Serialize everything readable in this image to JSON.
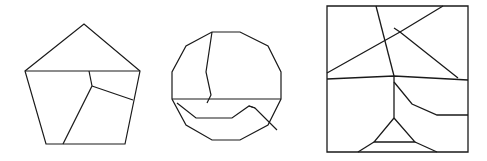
{
  "canvas": {
    "width": 487,
    "height": 161,
    "background_color": "#ffffff",
    "stroke_color": "#1a1a1a"
  },
  "figures": [
    {
      "name": "pentagon-figure",
      "shape": "pentagon",
      "stroke_width": 1.2,
      "outline": "25,71 84,24 140,71 125,144 46,144",
      "cuts": [
        "25,71 140,71",
        "92,86 133,100",
        "92,86 63,144",
        "92,86 89,71"
      ]
    },
    {
      "name": "decagon-figure",
      "shape": "decagon",
      "stroke_width": 1.2,
      "outline": "212,32 240,32 268,46 281,72 281,99 268,125 240,140 212,140 186,125 172,99 172,72 186,46",
      "cuts": [
        "172,99 281,99",
        "212,32 206,72 211,95 207,103",
        "177,103 196,118 232,118 249,106 255,108 277,130",
        "249,106 255,108"
      ]
    },
    {
      "name": "square-figure",
      "shape": "square",
      "stroke_width": 1.3,
      "outline": "327,6 468,6 468,152 327,152",
      "cuts": [
        "327,79 394,76 468,80",
        "327,73 400,32 443,6",
        "394,28 400,32 458,78",
        "376,6 394,76",
        "394,76 394,118",
        "394,118 374,142 415,142 394,118",
        "394,82 412,104 437,115 468,115",
        "374,142 358,152",
        "415,142 437,152"
      ]
    }
  ]
}
